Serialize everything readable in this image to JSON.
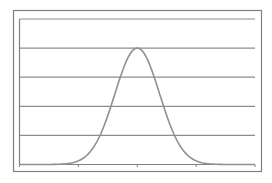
{
  "chart_data": {
    "type": "line",
    "title": "",
    "xlabel": "",
    "ylabel": "",
    "xlim": [
      0,
      8
    ],
    "ylim": [
      0,
      5
    ],
    "x_ticks": [
      0,
      2,
      4,
      6,
      8
    ],
    "y_gridlines": [
      0,
      1,
      2,
      3,
      4,
      5
    ],
    "grid": true,
    "legend": null,
    "series": [
      {
        "name": "bell curve",
        "x": [
          0,
          0.5,
          1,
          1.5,
          2,
          2.5,
          3,
          3.25,
          3.5,
          3.75,
          4,
          4.25,
          4.5,
          4.75,
          5,
          5.5,
          6,
          6.5,
          7,
          7.5,
          8
        ],
        "values": [
          0.0,
          0.0,
          0.0,
          0.0,
          0.02,
          0.17,
          0.87,
          1.49,
          2.27,
          3.05,
          4.0,
          3.05,
          2.27,
          1.49,
          0.87,
          0.17,
          0.02,
          0.0,
          0.0,
          0.0,
          0.0
        ]
      }
    ],
    "mean": 4,
    "stddev": 0.76,
    "peak": 4
  },
  "colors": {
    "frame": "#808080",
    "axis": "#808080",
    "gridline": "#8c8c8c",
    "curve": "#909090",
    "background": "#ffffff"
  }
}
